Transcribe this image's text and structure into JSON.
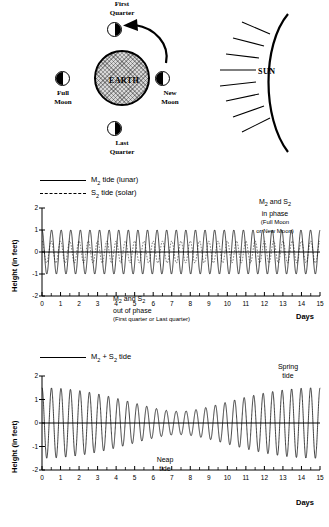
{
  "diagram": {
    "earth_label": "EARTH",
    "sun_label": "SUN",
    "moons": [
      {
        "id": "first-quarter",
        "line1": "First",
        "line2": "Quarter",
        "shade": "dark-right"
      },
      {
        "id": "full",
        "line1": "Full",
        "line2": "Moon",
        "shade": "dark-left"
      },
      {
        "id": "new",
        "line1": "New",
        "line2": "Moon",
        "shade": "dark-left"
      },
      {
        "id": "last-quarter",
        "line1": "Last",
        "line2": "Quarter",
        "shade": "dark-right"
      }
    ],
    "caption_first_quarter_l1": "First",
    "caption_first_quarter_l2": "Quarter",
    "caption_full_l1": "Full",
    "caption_full_l2": "Moon",
    "caption_new_l1": "New",
    "caption_new_l2": "Moon",
    "caption_last_quarter_l1": "Last",
    "caption_last_quarter_l2": "Quarter"
  },
  "chart_top": {
    "legend": [
      {
        "label_main": "M",
        "label_sub": "2",
        "label_rest": " tide (lunar)",
        "style": "solid"
      },
      {
        "label_main": "S",
        "label_sub": "2",
        "label_rest": " tide (solar)",
        "style": "dashed"
      }
    ],
    "legend_1_main": "M",
    "legend_1_sub": "2",
    "legend_1_rest": " tide (lunar)",
    "legend_2_main": "S",
    "legend_2_sub": "2",
    "legend_2_rest": " tide (solar)",
    "ylabel": "Height (in feet)",
    "xlabel": "Days",
    "annot_inphase_l1_a": "M",
    "annot_inphase_l1_sub1": "2",
    "annot_inphase_l1_b": " and S",
    "annot_inphase_l1_sub2": "2",
    "annot_inphase_l2": "in phase",
    "annot_inphase_l3": "(Full Moon",
    "annot_inphase_l4": "or New Moon)",
    "annot_outphase_l1_a": "M",
    "annot_outphase_l1_sub1": "2",
    "annot_outphase_l1_b": " and S",
    "annot_outphase_l1_sub2": "2",
    "annot_outphase_l2": "out of phase",
    "annot_outphase_l3": "(First quarter or Last quarter)"
  },
  "chart_bottom": {
    "legend_main": "M",
    "legend_sub1": "2",
    "legend_plus": " + S",
    "legend_sub2": "2",
    "legend_rest": " tide",
    "ylabel": "Height (in feet)",
    "xlabel": "Days",
    "annot_spring_l1": "Spring",
    "annot_spring_l2": "tide",
    "annot_neap_l1": "Neap",
    "annot_neap_l2": "tide"
  },
  "chart_data": [
    {
      "type": "line",
      "id": "m2-s2-components",
      "title": "M2 tide (lunar) and S2 tide (solar)",
      "xlabel": "Days",
      "ylabel": "Height (in feet)",
      "xlim": [
        0,
        15
      ],
      "ylim": [
        -2,
        2
      ],
      "xticks": [
        0,
        1,
        2,
        3,
        4,
        5,
        6,
        7,
        8,
        9,
        10,
        11,
        12,
        13,
        14,
        15
      ],
      "yticks": [
        -2,
        -1,
        0,
        1,
        2
      ],
      "minor_x_ticks_per_unit": 2,
      "grid": false,
      "legend_position": "above-left",
      "series": [
        {
          "name": "M2 tide (lunar)",
          "style": "solid",
          "waveform": "cosine",
          "amplitude": 1.0,
          "period_days": 0.5175,
          "phase_deg": 0,
          "offset": 0
        },
        {
          "name": "S2 tide (solar)",
          "style": "dashed",
          "waveform": "cosine",
          "amplitude": 0.5,
          "period_days": 0.5,
          "phase_deg": 0,
          "offset": 0
        }
      ],
      "annotations": [
        {
          "text": "M2 and S2 in phase (Full Moon or New Moon)",
          "x": 15,
          "y": 1.9
        },
        {
          "text": "M2 and S2 out of phase (First quarter or Last quarter)",
          "x": 7.4,
          "y": -1.3
        }
      ]
    },
    {
      "type": "line",
      "id": "m2-plus-s2-sum",
      "title": "M2 + S2 tide",
      "xlabel": "Days",
      "ylabel": "Height (in feet)",
      "xlim": [
        0,
        15
      ],
      "ylim": [
        -2,
        2
      ],
      "xticks": [
        0,
        1,
        2,
        3,
        4,
        5,
        6,
        7,
        8,
        9,
        10,
        11,
        12,
        13,
        14,
        15
      ],
      "yticks": [
        -2,
        -1,
        0,
        1,
        2
      ],
      "minor_x_ticks_per_unit": 2,
      "grid": false,
      "legend_position": "above-left",
      "series": [
        {
          "name": "M2 + S2 tide",
          "style": "solid",
          "waveform": "sum-of-cosines",
          "envelope_max": 1.5,
          "envelope_min": 0.5,
          "beat_period_days": 14.77,
          "components": [
            {
              "amplitude": 1.0,
              "period_days": 0.5175
            },
            {
              "amplitude": 0.5,
              "period_days": 0.5
            }
          ]
        }
      ],
      "annotations": [
        {
          "text": "Spring tide",
          "x": 14.6,
          "y": 1.85
        },
        {
          "text": "Neap tide",
          "x": 7.5,
          "y": -1.0
        }
      ]
    }
  ]
}
